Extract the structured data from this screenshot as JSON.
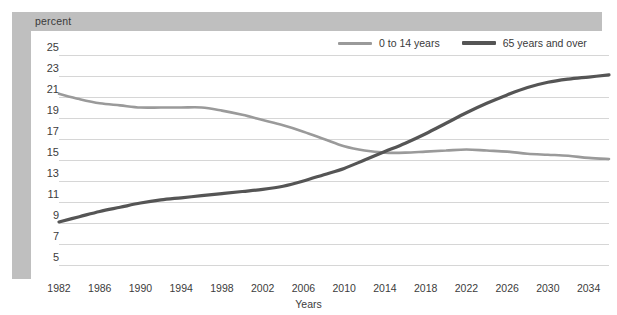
{
  "header": {
    "unit_label": "percent"
  },
  "legend": {
    "position": "top-right",
    "items": [
      {
        "label": "0 to 14 years",
        "color": "#9a9a9a",
        "weight": "thin"
      },
      {
        "label": "65 years and over",
        "color": "#555555",
        "weight": "thick"
      }
    ]
  },
  "axes": {
    "x_title": "Years",
    "y_title": "percent",
    "y_ticks": [
      "25",
      "23",
      "21",
      "19",
      "17",
      "15",
      "13",
      "11",
      "9",
      "7",
      "5"
    ],
    "x_ticks": [
      "1982",
      "1986",
      "1990",
      "1994",
      "1998",
      "2002",
      "2006",
      "2010",
      "2014",
      "2018",
      "2022",
      "2026",
      "2030",
      "2034"
    ]
  },
  "colors": {
    "band": "#bfbfbf",
    "gridline": "#d6d6d6",
    "series_young": "#9a9a9a",
    "series_old": "#555555",
    "text": "#3c3c3c",
    "plot_background": "#ffffff"
  },
  "chart_data": {
    "type": "line",
    "title": "",
    "subtitle": "",
    "xlabel": "Years",
    "ylabel": "percent",
    "xlim": [
      1982,
      2036
    ],
    "ylim": [
      4,
      26
    ],
    "grid": true,
    "legend_position": "top-right",
    "x": [
      1982,
      1984,
      1986,
      1988,
      1990,
      1992,
      1994,
      1996,
      1998,
      2000,
      2002,
      2004,
      2006,
      2008,
      2010,
      2012,
      2014,
      2016,
      2018,
      2020,
      2022,
      2024,
      2026,
      2028,
      2030,
      2032,
      2034,
      2036
    ],
    "series": [
      {
        "name": "0 to 14 years",
        "color": "#9a9a9a",
        "values": [
          21.3,
          20.8,
          20.4,
          20.2,
          20.0,
          20.0,
          20.0,
          20.0,
          19.7,
          19.3,
          18.8,
          18.3,
          17.7,
          17.0,
          16.3,
          15.9,
          15.7,
          15.7,
          15.8,
          15.9,
          16.0,
          15.9,
          15.8,
          15.6,
          15.5,
          15.4,
          15.2,
          15.1
        ]
      },
      {
        "name": "65 years and over",
        "color": "#555555",
        "values": [
          9.1,
          9.6,
          10.1,
          10.5,
          10.9,
          11.2,
          11.4,
          11.6,
          11.8,
          12.0,
          12.2,
          12.5,
          13.0,
          13.6,
          14.2,
          15.0,
          15.8,
          16.6,
          17.5,
          18.5,
          19.5,
          20.4,
          21.2,
          21.9,
          22.4,
          22.7,
          22.9,
          23.1
        ]
      }
    ]
  }
}
